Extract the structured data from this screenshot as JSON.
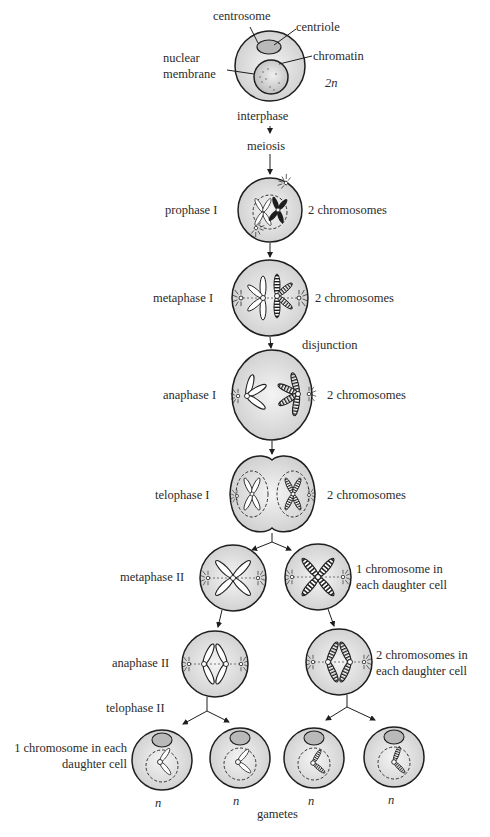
{
  "colors": {
    "cell_fill": "#d6d6d6",
    "cell_stroke": "#1e1e1e",
    "nucleus_fill": "#c4c4c4",
    "centrosome_fill": "#b5b5b5",
    "text": "#2b2b2b"
  },
  "interphase": {
    "labels": {
      "centrosome": "centrosome",
      "centriole": "centriole",
      "nuclear_membrane_1": "nuclear",
      "nuclear_membrane_2": "membrane",
      "chromatin": "chromatin",
      "ploidy": "2n"
    },
    "stage": "interphase"
  },
  "process": "meiosis",
  "stages": [
    {
      "name": "prophase I",
      "note": "2 chromosomes"
    },
    {
      "name": "metaphase I",
      "note": "2 chromosomes"
    },
    {
      "name": "anaphase I",
      "note": "2 chromosomes",
      "event": "disjunction"
    },
    {
      "name": "telophase I",
      "note": "2 chromosomes"
    },
    {
      "name": "metaphase II",
      "note_line1": "1 chromosome in",
      "note_line2": "each daughter cell"
    },
    {
      "name": "anaphase II",
      "note_line1": "2 chromosomes in",
      "note_line2": "each daughter cell"
    },
    {
      "name": "telophase II",
      "note_line1": "1 chromosome in each",
      "note_line2": "daughter cell"
    }
  ],
  "gametes": {
    "label": "gametes",
    "ploidy": [
      "n",
      "n",
      "n",
      "n"
    ]
  }
}
